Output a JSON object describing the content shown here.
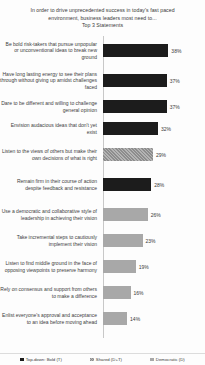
{
  "chart_data": {
    "type": "bar",
    "orientation": "horizontal",
    "title": "In order to drive unprecedented success in today's fast paced environment, business leaders most need to...",
    "subtitle": "Top 3 Statements",
    "xlabel": "",
    "ylabel": "",
    "xlim": [
      0,
      40
    ],
    "grid": false,
    "legend_position": "bottom",
    "categories": [
      "Be bold risk-takers  that pursue unpopular or unconventional ideas to break new ground",
      "Have long lasting energy to see their plans through without giving up amidst challenges faced",
      "Dare to be different and willing to challenge  general opinion",
      "Envision audacious ideas that don't yet exist",
      "Listen to the views of others but make their own decisions of what is right",
      "Remain firm in their course of action despite feedback and resistance",
      "Use a democratic and collaborative style of leadership  in achieving their vision",
      "Take incremental steps to cautiously implement their vision",
      "Listen to find middle ground in the face of opposing viewpoints  to preserve harmony",
      "Rely on consensus and support from others to make a difference",
      "Enlist everyone's approval and acceptance to an idea before moving ahead"
    ],
    "values": [
      38,
      37,
      37,
      32,
      29,
      28,
      26,
      23,
      19,
      16,
      14
    ],
    "value_labels": [
      "38%",
      "37%",
      "37%",
      "32%",
      "29%",
      "28%",
      "26%",
      "23%",
      "19%",
      "16%",
      "14%"
    ],
    "series_of_bar": [
      "dark",
      "dark",
      "dark",
      "dark",
      "hatch",
      "dark",
      "grey",
      "grey",
      "grey",
      "grey",
      "grey"
    ],
    "legend": [
      {
        "label": "Top-down: Bold (T)",
        "style": "dark",
        "color": "#1c1c1c"
      },
      {
        "label": "Shared (D+T)",
        "style": "hatch",
        "color": "#a0a0a0"
      },
      {
        "label": "Democratic (D)",
        "style": "grey",
        "color": "#a8a8a8"
      }
    ]
  }
}
